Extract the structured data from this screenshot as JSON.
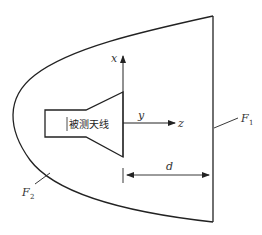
{
  "diagram": {
    "antenna_label": "被测天线",
    "axes": {
      "x_label": "x",
      "y_label": "y",
      "z_label": "z"
    },
    "surfaces": {
      "f1": {
        "main": "F",
        "sub": "1"
      },
      "f2": {
        "main": "F",
        "sub": "2"
      }
    },
    "dimension": {
      "label": "d"
    },
    "colors": {
      "stroke": "#222222",
      "background": "#ffffff"
    }
  }
}
